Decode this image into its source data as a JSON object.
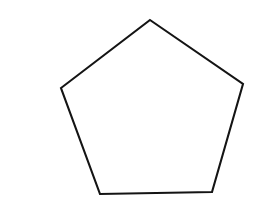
{
  "canvas": {
    "width": 258,
    "height": 211,
    "background_color": "#ffffff",
    "description": "Line drawing of a regular pentagon"
  },
  "shape": {
    "name": "pentagon",
    "sides": 5,
    "fill_color": "#ffffff",
    "stroke_color": "#141414",
    "stroke_width": 2.1,
    "closed": true,
    "vertices": [
      {
        "label": "top-apex",
        "x": 150,
        "y": 20
      },
      {
        "label": "right",
        "x": 243,
        "y": 84
      },
      {
        "label": "bottom-right",
        "x": 212,
        "y": 192
      },
      {
        "label": "bottom-left",
        "x": 100,
        "y": 194
      },
      {
        "label": "left",
        "x": 61,
        "y": 88
      }
    ],
    "points_attr": "150,20 243,84 212,192 100,194 61,88"
  }
}
